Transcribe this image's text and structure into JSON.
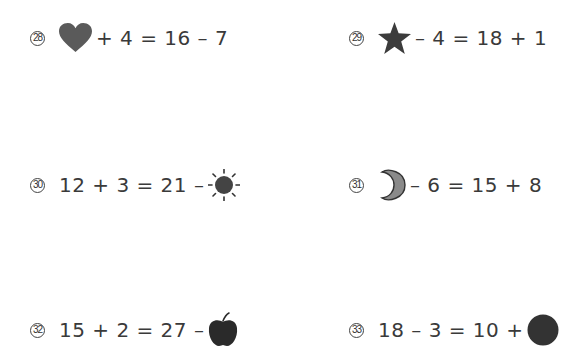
{
  "worksheet": {
    "problems": [
      {
        "number": "28",
        "icon": "heart-icon",
        "icon_color": "#5a5a5a",
        "before": "",
        "after": "+ 4 = 16 – 7"
      },
      {
        "number": "29",
        "icon": "star-icon",
        "icon_color": "#3c3c3c",
        "before": "",
        "after": "– 4 = 18 + 1"
      },
      {
        "number": "30",
        "icon": "sun-icon",
        "icon_color": "#444444",
        "before": "12 + 3 = 21 –",
        "after": ""
      },
      {
        "number": "31",
        "icon": "moon-icon",
        "icon_color": "#8a8a8a",
        "before": "",
        "after": "– 6 = 15 + 8"
      },
      {
        "number": "32",
        "icon": "apple-icon",
        "icon_color": "#2a2a2a",
        "before": "15 + 2 = 27 –",
        "after": ""
      },
      {
        "number": "33",
        "icon": "circle-icon",
        "icon_color": "#333333",
        "before": "18 – 3 = 10 +",
        "after": ""
      }
    ]
  }
}
